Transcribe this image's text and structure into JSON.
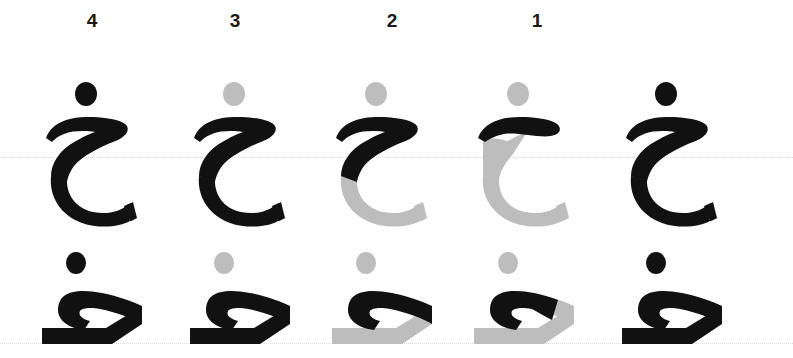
{
  "figure": {
    "background_color": "#ffffff",
    "ink_color": "#111111",
    "ghost_color": "#bdbdbd",
    "guide_color": "#d9d9d9"
  },
  "column_labels": [
    {
      "text": "4",
      "x": 72
    },
    {
      "text": "3",
      "x": 215
    },
    {
      "text": "2",
      "x": 372
    },
    {
      "text": "1",
      "x": 517
    }
  ],
  "guides": [
    {
      "name": "row-1-baseline",
      "y": 157
    },
    {
      "name": "row-2-baseline",
      "y": 343
    }
  ],
  "rows": [
    {
      "name": "isolated-form",
      "letter": "خ",
      "y": 72,
      "cells": [
        {
          "step": "4",
          "x": 20,
          "dot": "off",
          "body_top": "on",
          "body_bowl": "on",
          "body_tail": "on"
        },
        {
          "step": "3",
          "x": 168,
          "dot": "off",
          "body_top": "on",
          "body_bowl": "on",
          "body_tail": "on"
        },
        {
          "step": "2",
          "x": 310,
          "dot": "off",
          "body_top": "on",
          "body_bowl": "off",
          "body_tail": "off"
        },
        {
          "step": "1",
          "x": 452,
          "dot": "off",
          "body_top": "on",
          "body_bowl": "off",
          "body_tail": "off"
        },
        {
          "step": "0",
          "x": 600,
          "dot": "on",
          "body_top": "on",
          "body_bowl": "on",
          "body_tail": "on"
        }
      ]
    },
    {
      "name": "connected-form",
      "letter": "ـخـ",
      "y": 248,
      "cells": [
        {
          "step": "4",
          "x": 20,
          "dot": "off",
          "hook": "on",
          "base": "on"
        },
        {
          "step": "3",
          "x": 168,
          "dot": "off",
          "hook": "on",
          "base": "on"
        },
        {
          "step": "2",
          "x": 310,
          "dot": "off",
          "hook": "on",
          "base": "off"
        },
        {
          "step": "1",
          "x": 452,
          "dot": "off",
          "hook": "on",
          "base": "off"
        },
        {
          "step": "0",
          "x": 600,
          "dot": "on",
          "hook": "on",
          "base": "on"
        }
      ]
    }
  ]
}
